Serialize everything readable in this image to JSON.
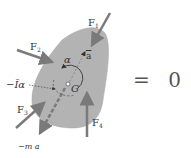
{
  "diagram": {
    "body": {
      "name": "rigid body",
      "fill": "#b3b3b3",
      "center_label": "G"
    },
    "forces": [
      {
        "id": "F1",
        "label": "F",
        "sub": "1"
      },
      {
        "id": "F2",
        "label": "F",
        "sub": "2"
      },
      {
        "id": "F3",
        "label": "F",
        "sub": "3"
      },
      {
        "id": "F4",
        "label": "F",
        "sub": "4"
      }
    ],
    "accel_label": "a",
    "angular_accel_label": "α",
    "inertial_couple_label": "−Īα",
    "inertial_force_label": "−m a",
    "equation": {
      "equals": "=",
      "rhs": "0"
    },
    "colors": {
      "arrow": "#7a7a7a",
      "body": "#b3b3b3",
      "text": "#333333"
    }
  }
}
